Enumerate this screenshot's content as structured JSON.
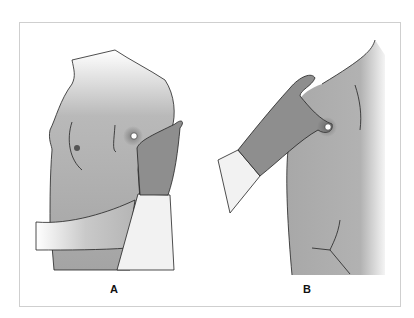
{
  "figure": {
    "panels": [
      {
        "label": "A",
        "description": "Anterior view: examiner palpating the axilla with fingers while supporting the patient's arm"
      },
      {
        "label": "B",
        "description": "Lateral view: examiner's hand palpating the high axilla"
      }
    ]
  },
  "colors": {
    "skin": "#a8a8a8",
    "skin_light": "#e6e6e6",
    "outline": "#222222",
    "sleeve": "#f2f2f2",
    "hand": "#8e8e8e",
    "frame": "#cfcfcf"
  }
}
